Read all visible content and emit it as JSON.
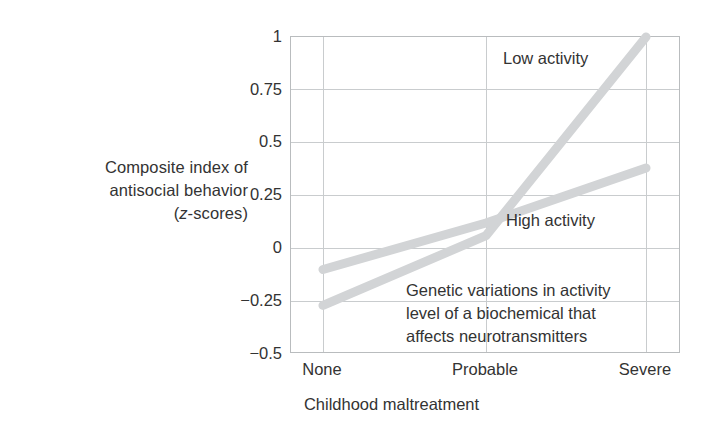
{
  "chart_data": {
    "type": "line",
    "title": "",
    "xlabel": "Childhood maltreatment",
    "ylabel": "Composite index of antisocial behavior (z-scores)",
    "categories": [
      "None",
      "Probable",
      "Severe"
    ],
    "xticklabels": [
      "None",
      "Probable",
      "Severe"
    ],
    "yticklabels": [
      "1",
      "0.75",
      "0.5",
      "0.25",
      "0",
      "−0.25",
      "−0.5"
    ],
    "ytickvalues": [
      1,
      0.75,
      0.5,
      0.25,
      0,
      -0.25,
      -0.5
    ],
    "ylim": [
      -0.5,
      1
    ],
    "grid": true,
    "legend_position": "inline-annotations",
    "series": [
      {
        "name": "Low activity",
        "values": [
          -0.27,
          0.06,
          1.0
        ],
        "color": "#d2d4d6"
      },
      {
        "name": "High activity",
        "values": [
          -0.1,
          0.12,
          0.38
        ],
        "color": "#d2d4d6"
      }
    ],
    "annotations": [
      {
        "id": "low-activity",
        "text": "Low activity"
      },
      {
        "id": "high-activity",
        "text": "High activity"
      },
      {
        "id": "note",
        "text": "Genetic variations in activity\nlevel of a biochemical that\naffects neurotransmitters"
      }
    ]
  },
  "axis": {
    "y_title_line1": "Composite index of",
    "y_title_line2": "antisocial behavior",
    "y_title_line3_open": "(",
    "y_title_line3_italic": "z",
    "y_title_line3_rest": "-scores)",
    "x_title": "Childhood maltreatment"
  },
  "colors": {
    "line": "#d2d4d6",
    "grid": "#c9ccce",
    "axis": "#b9bcbe",
    "text": "#333333",
    "background": "#ffffff"
  }
}
